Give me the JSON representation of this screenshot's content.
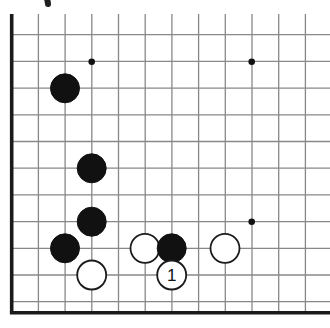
{
  "diagram": {
    "type": "go-board-diagram",
    "board": {
      "cropped": true,
      "edges_shown": [
        "left",
        "bottom"
      ],
      "columns": 12,
      "rows": 12,
      "spacing_px": 26.7,
      "origin_x_px": 11.7,
      "origin_y_px": 8.0,
      "grid_line_color": "#888888",
      "edge_line_color": "#1a1a1a",
      "background_color": "#ffffff"
    },
    "star_points": [
      {
        "col": 3,
        "row": 2,
        "x": 91.7,
        "y": 61.7
      },
      {
        "col": 9,
        "row": 2,
        "x": 251.7,
        "y": 61.7
      },
      {
        "col": 9,
        "row": 8,
        "x": 251.7,
        "y": 221.7
      }
    ],
    "stones": [
      {
        "id": "b1",
        "color": "black",
        "col": 2,
        "row": 3,
        "x": 65.0,
        "y": 88.3,
        "label": ""
      },
      {
        "id": "b2",
        "color": "black",
        "col": 3,
        "row": 6,
        "x": 91.7,
        "y": 168.3,
        "label": ""
      },
      {
        "id": "b3",
        "color": "black",
        "col": 3,
        "row": 8,
        "x": 91.7,
        "y": 221.7,
        "label": ""
      },
      {
        "id": "b4",
        "color": "black",
        "col": 2,
        "row": 9,
        "x": 65.0,
        "y": 248.3,
        "label": ""
      },
      {
        "id": "w1",
        "color": "white",
        "col": 3,
        "row": 10,
        "x": 91.7,
        "y": 275.0,
        "label": ""
      },
      {
        "id": "w2",
        "color": "white",
        "col": 5,
        "row": 9,
        "x": 145.0,
        "y": 248.3,
        "label": ""
      },
      {
        "id": "b5",
        "color": "black",
        "col": 6,
        "row": 9,
        "x": 171.7,
        "y": 248.3,
        "label": ""
      },
      {
        "id": "w3",
        "color": "white",
        "col": 8,
        "row": 9,
        "x": 225.0,
        "y": 248.3,
        "label": ""
      },
      {
        "id": "w4",
        "color": "white",
        "col": 6,
        "row": 10,
        "x": 171.7,
        "y": 275.0,
        "label": "1"
      }
    ],
    "stone_radius_px": 14.5,
    "stone_colors": {
      "black_fill": "#111111",
      "black_stroke": "#111111",
      "white_fill": "#ffffff",
      "white_stroke": "#1a1a1a",
      "white_label_color": "#111111",
      "black_label_color": "#ffffff"
    },
    "corner_mark": {
      "present": true,
      "description": "partial dark arc at top-left corner"
    }
  }
}
